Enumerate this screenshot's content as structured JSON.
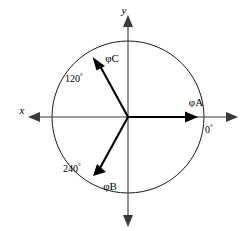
{
  "figure": {
    "background_color": "#ffffff",
    "axes": {
      "x_label": "x",
      "y_label": "y",
      "x_axis_color": "#3a3a3a",
      "y_axis_color": "#3a3a3a"
    },
    "circle": {
      "center_x": 128,
      "center_y": 117,
      "radius": 76,
      "stroke_color": "#1a1a1a"
    },
    "phasors": [
      {
        "id": "phase-a",
        "label": "φA",
        "angle_label": "0",
        "angle_degrees": 0,
        "length": 69,
        "color": "#000000",
        "label_x": 196,
        "label_y": 106,
        "angle_label_x": 209,
        "angle_label_y": 133
      },
      {
        "id": "phase-c",
        "label": "φC",
        "angle_label": "120",
        "angle_degrees": 120,
        "length": 69,
        "color": "#000000",
        "label_x": 99,
        "label_y": 60,
        "angle_label_x": 66,
        "angle_label_y": 79
      },
      {
        "id": "phase-b",
        "label": "φB",
        "angle_label": "240",
        "angle_degrees": 240,
        "length": 69,
        "color": "#000000",
        "label_x": 97,
        "label_y": 188,
        "angle_label_x": 64,
        "angle_label_y": 169
      }
    ],
    "degree_symbol": "°"
  }
}
